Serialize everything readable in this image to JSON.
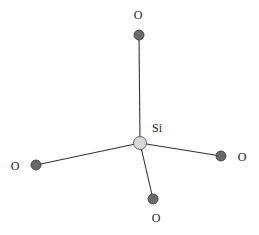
{
  "diagram": {
    "title": "",
    "type": "tetrahedral SiO4 molecular structure",
    "center_atom": {
      "label": "Si",
      "x": 140,
      "y": 143,
      "fill": "#d8d8d8"
    },
    "atoms": [
      {
        "id": "o-top",
        "label": "O",
        "x": 139,
        "y": 35,
        "label_x": 138,
        "label_y": 15
      },
      {
        "id": "o-left",
        "label": "O",
        "x": 36,
        "y": 165,
        "label_x": 15,
        "label_y": 166
      },
      {
        "id": "o-right",
        "label": "O",
        "x": 221,
        "y": 156,
        "label_x": 242,
        "label_y": 157
      },
      {
        "id": "o-bottom",
        "label": "O",
        "x": 153,
        "y": 199,
        "label_x": 156,
        "label_y": 218
      }
    ],
    "colors": {
      "oxygen": "#6a6a6a",
      "bond": "#333333",
      "text": "#222222"
    }
  }
}
